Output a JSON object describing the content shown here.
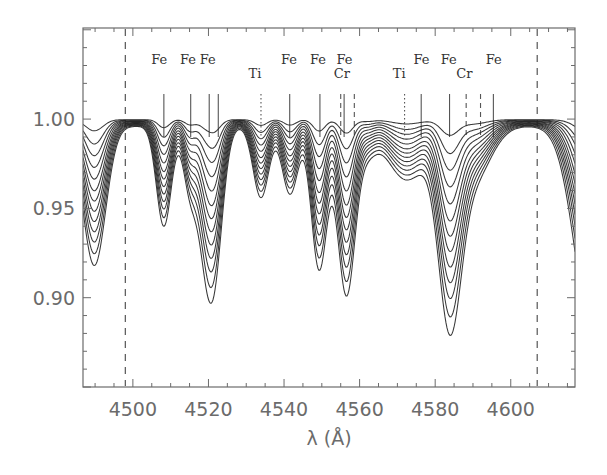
{
  "chart_data": {
    "type": "line",
    "title": "",
    "xlabel": "λ (Å)",
    "ylabel": "",
    "xlim": [
      4486.8,
      4617.0
    ],
    "ylim": [
      0.85,
      1.051
    ],
    "grid": false,
    "legend": null,
    "x_ticks": [
      4500,
      4520,
      4540,
      4560,
      4580,
      4600
    ],
    "x_tick_labels": [
      "4500",
      "4520",
      "4540",
      "4560",
      "4580",
      "4600"
    ],
    "x_minor_step": 5,
    "y_ticks": [
      0.9,
      0.95,
      1.0
    ],
    "y_tick_labels": [
      "0.90",
      "0.95",
      "1.00"
    ],
    "y_minor_step": 0.01,
    "vertical_dashed_lines": [
      4498.0,
      4607.0
    ],
    "n_curves": 13,
    "curve_depth_scales": [
      0.08,
      0.17,
      0.25,
      0.33,
      0.41,
      0.49,
      0.56,
      0.63,
      0.7,
      0.77,
      0.84,
      0.92,
      1.0
    ],
    "continuum": 1.0,
    "absorption_profile_deepest_curve": [
      {
        "center": 4489.8,
        "depth": 0.078,
        "sigma": 2.6
      },
      {
        "center": 4508.2,
        "depth": 0.056,
        "sigma": 1.7
      },
      {
        "center": 4515.2,
        "depth": 0.036,
        "sigma": 1.6
      },
      {
        "center": 4521.3,
        "depth": 0.086,
        "sigma": 2.0
      },
      {
        "center": 4518.6,
        "depth": 0.03,
        "sigma": 1.6
      },
      {
        "center": 4533.9,
        "depth": 0.04,
        "sigma": 1.8
      },
      {
        "center": 4541.6,
        "depth": 0.038,
        "sigma": 1.8
      },
      {
        "center": 4549.3,
        "depth": 0.08,
        "sigma": 1.8
      },
      {
        "center": 4556.5,
        "depth": 0.094,
        "sigma": 2.0
      },
      {
        "center": 4562.0,
        "depth": 0.012,
        "sigma": 2.0
      },
      {
        "center": 4572.5,
        "depth": 0.03,
        "sigma": 4.5
      },
      {
        "center": 4583.8,
        "depth": 0.102,
        "sigma": 2.6
      },
      {
        "center": 4590.0,
        "depth": 0.03,
        "sigma": 4.0
      },
      {
        "center": 4622.0,
        "depth": 0.12,
        "sigma": 4.2
      }
    ],
    "min_values_deepest_curve": [
      {
        "x": 4490.5,
        "y": 0.923
      },
      {
        "x": 4508.2,
        "y": 0.939
      },
      {
        "x": 4521.4,
        "y": 0.9
      },
      {
        "x": 4533.8,
        "y": 0.959
      },
      {
        "x": 4541.5,
        "y": 0.96
      },
      {
        "x": 4549.2,
        "y": 0.912
      },
      {
        "x": 4556.6,
        "y": 0.901
      },
      {
        "x": 4583.8,
        "y": 0.895
      }
    ],
    "line_markers": [
      {
        "x": 4508.2,
        "style": "solid",
        "label": "Fe",
        "label_row": 1
      },
      {
        "x": 4515.3,
        "style": "solid",
        "label": "Fe",
        "label_row": 1
      },
      {
        "x": 4520.2,
        "style": "solid",
        "label": "Fe",
        "label_row": 1
      },
      {
        "x": 4522.6,
        "style": "solid",
        "label": "",
        "label_row": 1
      },
      {
        "x": 4533.9,
        "style": "dotted",
        "label": "Ti",
        "label_row": 2
      },
      {
        "x": 4541.5,
        "style": "solid",
        "label": "Fe",
        "label_row": 1
      },
      {
        "x": 4549.5,
        "style": "solid",
        "label": "Fe",
        "label_row": 1
      },
      {
        "x": 4555.0,
        "style": "dashed",
        "label": "Cr",
        "label_row": 2
      },
      {
        "x": 4555.9,
        "style": "solid",
        "label": "Fe",
        "label_row": 1
      },
      {
        "x": 4558.6,
        "style": "dashed",
        "label": "",
        "label_row": 2
      },
      {
        "x": 4571.9,
        "style": "dotted",
        "label": "Ti",
        "label_row": 2
      },
      {
        "x": 4576.3,
        "style": "solid",
        "label": "Fe",
        "label_row": 1
      },
      {
        "x": 4583.8,
        "style": "solid",
        "label": "Fe",
        "label_row": 1
      },
      {
        "x": 4588.2,
        "style": "dashed",
        "label": "Cr",
        "label_row": 2
      },
      {
        "x": 4592.0,
        "style": "dashed",
        "label": "",
        "label_row": 2
      },
      {
        "x": 4595.4,
        "style": "solid",
        "label": "Fe",
        "label_row": 1
      }
    ],
    "element_labels": [
      {
        "text": "Fe",
        "x": 4507.0,
        "row": 1
      },
      {
        "text": "Fe",
        "x": 4514.6,
        "row": 1
      },
      {
        "text": "Fe",
        "x": 4519.8,
        "row": 1
      },
      {
        "text": "Ti",
        "x": 4532.3,
        "row": 2
      },
      {
        "text": "Fe",
        "x": 4541.3,
        "row": 1
      },
      {
        "text": "Fe",
        "x": 4549.0,
        "row": 1
      },
      {
        "text": "Fe",
        "x": 4556.0,
        "row": 1
      },
      {
        "text": "Cr",
        "x": 4555.3,
        "row": 2
      },
      {
        "text": "Ti",
        "x": 4570.5,
        "row": 2
      },
      {
        "text": "Fe",
        "x": 4576.4,
        "row": 1
      },
      {
        "text": "Fe",
        "x": 4583.6,
        "row": 1
      },
      {
        "text": "Cr",
        "x": 4587.7,
        "row": 2
      },
      {
        "text": "Fe",
        "x": 4595.5,
        "row": 1
      }
    ]
  },
  "colors": {
    "axis": "#6b6b6b",
    "curve": "#222222",
    "marker": "#555555",
    "label_text": "#333333",
    "tick_text": "#6b6b6b"
  }
}
